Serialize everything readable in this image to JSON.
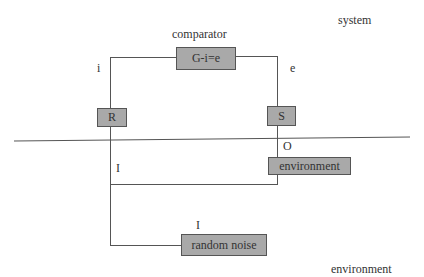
{
  "diagram": {
    "labels": {
      "system": "system",
      "comparator": "comparator",
      "i": "i",
      "e": "e",
      "I_mid": "I",
      "O": "O",
      "I_noise": "I",
      "environment_bottom": "environment"
    },
    "boxes": {
      "comparator": "G-i=e",
      "R": "R",
      "S": "S",
      "environment": "environment",
      "random_noise": "random noise"
    },
    "colors": {
      "box_fill": "#a9a9a9",
      "line": "#555555",
      "text": "#333333"
    }
  }
}
